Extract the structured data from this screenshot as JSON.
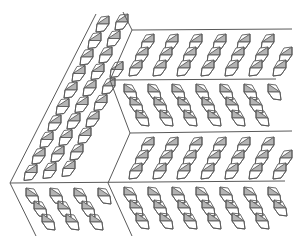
{
  "diagram": {
    "title": "",
    "colors": {
      "background": "#ffffff",
      "line": "#5a5a5a",
      "fill_gray": "#b4b4b4",
      "fill_white": "#ffffff"
    },
    "boundary_lines": [
      {
        "id": "left-outer-upper",
        "x1": 96,
        "y1": 14,
        "x2": 10,
        "y2": 183
      },
      {
        "id": "left-outer-lower",
        "x1": 10,
        "y1": 183,
        "x2": 36,
        "y2": 236
      },
      {
        "id": "left-inner-upper",
        "x1": 123,
        "y1": 12,
        "x2": 132,
        "y2": 30
      },
      {
        "id": "left-inner-mid",
        "x1": 132,
        "y1": 30,
        "x2": 110,
        "y2": 80
      },
      {
        "id": "left-inner-mid2",
        "x1": 110,
        "y1": 80,
        "x2": 130,
        "y2": 133
      },
      {
        "id": "left-inner-low",
        "x1": 130,
        "y1": 133,
        "x2": 108,
        "y2": 183
      },
      {
        "id": "left-inner-bottom",
        "x1": 108,
        "y1": 183,
        "x2": 132,
        "y2": 236
      },
      {
        "id": "band-line-1",
        "x1": 132,
        "y1": 30,
        "x2": 292,
        "y2": 29
      },
      {
        "id": "band-line-2",
        "x1": 110,
        "y1": 80,
        "x2": 276,
        "y2": 79
      },
      {
        "id": "band-line-3",
        "x1": 130,
        "y1": 133,
        "x2": 292,
        "y2": 131
      },
      {
        "id": "band-line-4",
        "x1": 10,
        "y1": 183,
        "x2": 285,
        "y2": 181
      }
    ],
    "regions": [
      {
        "id": "left-panel",
        "tile_orientation": "up-right",
        "rows": 8
      },
      {
        "id": "band-1",
        "tile_orientation": "up-right",
        "y_top": 30,
        "y_bottom": 80
      },
      {
        "id": "band-2",
        "tile_orientation": "down-right",
        "y_top": 80,
        "y_bottom": 133
      },
      {
        "id": "band-3",
        "tile_orientation": "up-right",
        "y_top": 133,
        "y_bottom": 183
      },
      {
        "id": "band-4",
        "tile_orientation": "down-right",
        "y_top": 183,
        "y_bottom": 236
      },
      {
        "id": "bottom-left-panel",
        "tile_orientation": "down-right",
        "y_top": 183,
        "y_bottom": 236
      }
    ]
  }
}
